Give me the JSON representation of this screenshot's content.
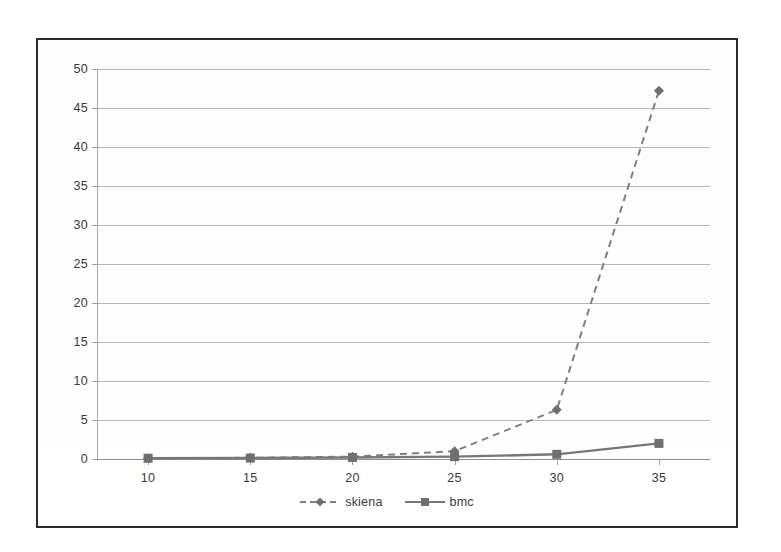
{
  "chart_data": {
    "type": "line",
    "title": "",
    "subtitle": "",
    "xlabel": "",
    "ylabel": "",
    "x": [
      10,
      15,
      20,
      25,
      30,
      35
    ],
    "categories": [
      "10",
      "15",
      "20",
      "25",
      "30",
      "35"
    ],
    "series": [
      {
        "name": "skiena",
        "values": [
          0.1,
          0.15,
          0.3,
          1.0,
          6.3,
          47.2
        ],
        "line_style": "dashed",
        "marker": "diamond",
        "color": "#808080"
      },
      {
        "name": "bmc",
        "values": [
          0.1,
          0.12,
          0.2,
          0.3,
          0.6,
          2.0
        ],
        "line_style": "solid",
        "marker": "square",
        "color": "#777777"
      }
    ],
    "xlim": [
      7.5,
      37.5
    ],
    "ylim": [
      0,
      50
    ],
    "y_ticks": [
      0,
      5,
      10,
      15,
      20,
      25,
      30,
      35,
      40,
      45,
      50
    ],
    "x_ticks": [
      10,
      15,
      20,
      25,
      30,
      35
    ],
    "grid": true,
    "grid_axis": "y",
    "legend_position": "bottom"
  },
  "axes": {
    "y_tick_labels": [
      "50",
      "45",
      "40",
      "35",
      "30",
      "25",
      "20",
      "15",
      "10",
      "5",
      "0"
    ],
    "x_tick_labels": [
      "10",
      "15",
      "20",
      "25",
      "30",
      "35"
    ]
  },
  "legend": {
    "entries": [
      {
        "label": "skiena",
        "marker": "diamond",
        "style": "dashed"
      },
      {
        "label": "bmc",
        "marker": "square",
        "style": "solid"
      }
    ]
  },
  "colors": {
    "border": "#2b2b2b",
    "gridline": "#b7b7b7",
    "axis": "#a0a0a0",
    "series_skiena": "#808080",
    "series_bmc": "#777777",
    "text": "#3a3a3a",
    "background": "#ffffff"
  }
}
